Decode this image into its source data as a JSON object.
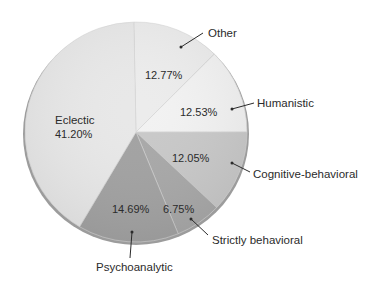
{
  "chart_data": {
    "type": "pie",
    "title": "",
    "start_angle_deg": -1.1,
    "direction": "clockwise",
    "slices": [
      {
        "label": "Other",
        "value": 12.77,
        "value_label": "12.77%",
        "color": "#ececec"
      },
      {
        "label": "Humanistic",
        "value": 12.53,
        "value_label": "12.53%",
        "color": "#f2f2f2"
      },
      {
        "label": "Cognitive-behavioral",
        "value": 12.05,
        "value_label": "12.05%",
        "color": "#c9c9c9"
      },
      {
        "label": "Strictly behavioral",
        "value": 6.75,
        "value_label": "6.75%",
        "color": "#a9a9a9"
      },
      {
        "label": "Psychoanalytic",
        "value": 14.69,
        "value_label": "14.69%",
        "color": "#a3a3a3"
      },
      {
        "label": "Eclectic",
        "value": 41.2,
        "value_label": "41.20%",
        "color": "#e8e8e8"
      }
    ],
    "legend": "none (callout labels with leader lines)",
    "rim_color": "#9a9a9a"
  },
  "labels": {
    "other": "Other",
    "humanistic": "Humanistic",
    "cognitive": "Cognitive-behavioral",
    "strictly": "Strictly behavioral",
    "psycho": "Psychoanalytic",
    "eclectic": "Eclectic",
    "pct_other": "12.77%",
    "pct_humanistic": "12.53%",
    "pct_cognitive": "12.05%",
    "pct_strictly": "6.75%",
    "pct_psycho": "14.69%",
    "pct_eclectic": "41.20%"
  }
}
